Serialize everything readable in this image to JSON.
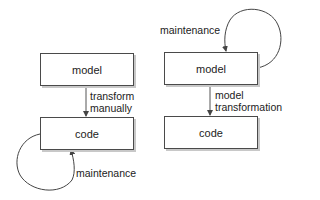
{
  "left_diagram": {
    "top_box": "model",
    "bottom_box": "code",
    "arrow_label_line1": "transform",
    "arrow_label_line2": "manually",
    "loop_label": "maintenance"
  },
  "right_diagram": {
    "top_box": "model",
    "bottom_box": "code",
    "arrow_label_line1": "model",
    "arrow_label_line2": "transformation",
    "loop_label": "maintenance"
  }
}
